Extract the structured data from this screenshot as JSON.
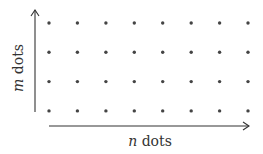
{
  "diagram": {
    "rows": 4,
    "columns": 8,
    "x_label_var": "n",
    "x_label_text": " dots",
    "y_label_var": "m",
    "y_label_text": " dots",
    "colors": {
      "dot": "#444444",
      "axis": "#333333",
      "background": "#ffffff"
    }
  }
}
